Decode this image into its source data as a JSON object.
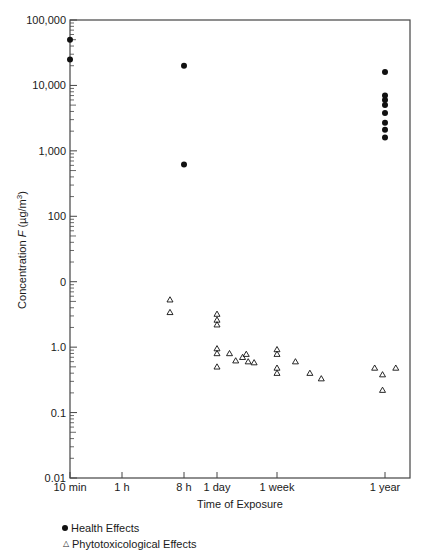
{
  "chart_data": {
    "type": "scatter",
    "title": "",
    "xlabel": "Time of Exposure",
    "ylabel": "Concentration F (µg/m³)",
    "yscale": "log",
    "ylim": [
      0.01,
      100000
    ],
    "y_tick_labels": [
      "100,000",
      "10,000",
      "1,000",
      "100",
      "0",
      "1.0",
      "0.1",
      "0.01"
    ],
    "y_tick_values": [
      100000,
      10000,
      1000,
      100,
      10,
      1,
      0.1,
      0.01
    ],
    "x_tick_labels": [
      "10 min",
      "1 h",
      "8 h",
      "1 day",
      "1 week",
      "1 year"
    ],
    "x_tick_hours": [
      0.1667,
      1,
      8,
      24,
      168,
      8760
    ],
    "xscale": "log",
    "grid": false,
    "legend_position": "bottom-left",
    "series": [
      {
        "name": "Health Effects",
        "marker": "filled-circle",
        "points": [
          {
            "x_hours": 0.1667,
            "y": 50000
          },
          {
            "x_hours": 0.1667,
            "y": 25000
          },
          {
            "x_hours": 8,
            "y": 20000
          },
          {
            "x_hours": 8,
            "y": 620
          },
          {
            "x_hours": 8760,
            "y": 16000
          },
          {
            "x_hours": 8760,
            "y": 7000
          },
          {
            "x_hours": 8760,
            "y": 6000
          },
          {
            "x_hours": 8760,
            "y": 5000
          },
          {
            "x_hours": 8760,
            "y": 3800
          },
          {
            "x_hours": 8760,
            "y": 2700
          },
          {
            "x_hours": 8760,
            "y": 2100
          },
          {
            "x_hours": 8760,
            "y": 1600
          }
        ]
      },
      {
        "name": "Phytotoxicological Effects",
        "marker": "open-triangle",
        "points": [
          {
            "x_hours": 5,
            "y": 5.3
          },
          {
            "x_hours": 5,
            "y": 3.4
          },
          {
            "x_hours": 24,
            "y": 3.2
          },
          {
            "x_hours": 24,
            "y": 2.6
          },
          {
            "x_hours": 24,
            "y": 2.2
          },
          {
            "x_hours": 24,
            "y": 0.95
          },
          {
            "x_hours": 24,
            "y": 0.8
          },
          {
            "x_hours": 24,
            "y": 0.5
          },
          {
            "x_hours": 36,
            "y": 0.8
          },
          {
            "x_hours": 44,
            "y": 0.62
          },
          {
            "x_hours": 55,
            "y": 0.7
          },
          {
            "x_hours": 62,
            "y": 0.78
          },
          {
            "x_hours": 66,
            "y": 0.6
          },
          {
            "x_hours": 80,
            "y": 0.58
          },
          {
            "x_hours": 168,
            "y": 0.92
          },
          {
            "x_hours": 168,
            "y": 0.78
          },
          {
            "x_hours": 168,
            "y": 0.48
          },
          {
            "x_hours": 168,
            "y": 0.4
          },
          {
            "x_hours": 330,
            "y": 0.6
          },
          {
            "x_hours": 560,
            "y": 0.4
          },
          {
            "x_hours": 850,
            "y": 0.33
          },
          {
            "x_hours": 6000,
            "y": 0.48
          },
          {
            "x_hours": 8000,
            "y": 0.38
          },
          {
            "x_hours": 8000,
            "y": 0.22
          },
          {
            "x_hours": 12500,
            "y": 0.48
          }
        ]
      }
    ]
  },
  "legend": {
    "items": [
      {
        "label": "Health Effects",
        "icon": "filled-circle"
      },
      {
        "label": "Phytotoxicological Effects",
        "icon": "open-triangle"
      }
    ]
  },
  "colors": {
    "axis": "#444444",
    "marker": "#111111"
  }
}
